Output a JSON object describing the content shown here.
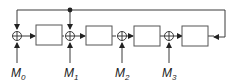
{
  "diagram": {
    "type": "block-diagram",
    "colors": {
      "line": "#3a3a3a",
      "box_stroke": "#555555",
      "background": "#ffffff"
    },
    "inputs": [
      {
        "base": "M",
        "sub": "0"
      },
      {
        "base": "M",
        "sub": "1"
      },
      {
        "base": "M",
        "sub": "2"
      },
      {
        "base": "M",
        "sub": "3"
      }
    ],
    "adders": 4,
    "blocks": 4
  }
}
